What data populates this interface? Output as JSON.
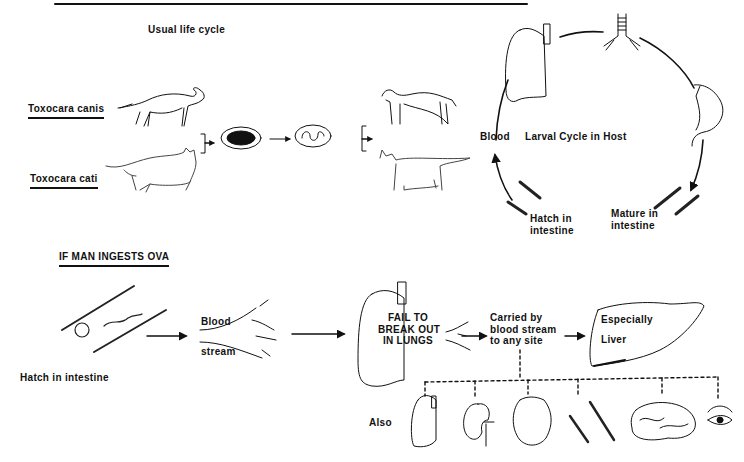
{
  "usual_cycle": {
    "title": "Usual   life   cycle",
    "host_dog": "Toxocara  canis",
    "host_cat": "Toxocara  cati",
    "larval_cycle": {
      "title": "Larval  Cycle  in  Host",
      "blood": "Blood",
      "hatch_line1": "Hatch in",
      "hatch_line2": "intestine",
      "mature_line1": "Mature  in",
      "mature_line2": "intestine"
    }
  },
  "man_ingests": {
    "title": "IF  MAN   INGESTS   OVA",
    "hatch": "Hatch  in  intestine",
    "blood": "Blood",
    "stream": "stream",
    "lungs_line1": "FAIL TO",
    "lungs_line2": "BREAK OUT",
    "lungs_line3": "IN  LUNGS",
    "carried_line1": "Carried  by",
    "carried_line2": "blood  stream",
    "carried_line3": "to any site",
    "liver_line1": "Especially",
    "liver_line2": "Liver",
    "also": "Also",
    "also_sites": [
      "lung",
      "kidney",
      "heart",
      "muscle",
      "brain",
      "eye"
    ]
  }
}
